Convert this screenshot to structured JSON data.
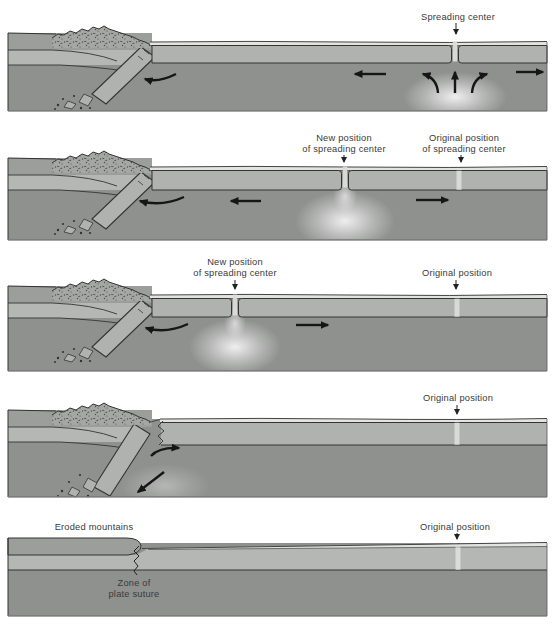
{
  "panels": [
    {
      "name": "stage-1",
      "labels": {
        "spreading_center": "Spreading center"
      }
    },
    {
      "name": "stage-2",
      "labels": {
        "new_position_l1": "New position",
        "new_position_l2": "of spreading center",
        "original_position_l1": "Original position",
        "original_position_l2": "of spreading center"
      }
    },
    {
      "name": "stage-3",
      "labels": {
        "new_position_l1": "New position",
        "new_position_l2": "of spreading center",
        "original_position": "Original position"
      }
    },
    {
      "name": "stage-4",
      "labels": {
        "original_position": "Original position"
      }
    },
    {
      "name": "stage-5",
      "labels": {
        "eroded_mountains": "Eroded mountains",
        "zone_of_plate_suture_l1": "Zone of",
        "zone_of_plate_suture_l2": "plate suture",
        "original_position": "Original position"
      }
    }
  ],
  "colors": {
    "mantle": "#8f918f",
    "oceanic_crust": "#b0b2b0",
    "continent_upper": "#9c9e9c",
    "continental_crust": "#b5b7b5",
    "sediment_layer": "#e3e4e2",
    "mountain_fill": "#a5a7a4",
    "outline": "#333333",
    "arrow": "#161616",
    "label_text": "#3a3a3a",
    "upwelling_glow": "#ffffff",
    "original_position_marker": "#dedfdd"
  }
}
